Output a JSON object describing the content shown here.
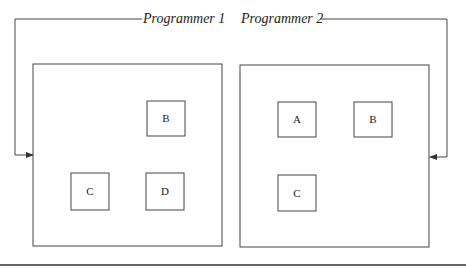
{
  "labels": {
    "programmer1": "Programmer 1",
    "programmer2": "Programmer 2"
  },
  "left_window": {
    "boxes": [
      {
        "label": "B"
      },
      {
        "label": "C"
      },
      {
        "label": "D"
      }
    ]
  },
  "right_window": {
    "boxes": [
      {
        "label": "A"
      },
      {
        "label": "B"
      },
      {
        "label": "C"
      }
    ]
  },
  "colors": {
    "stroke": "#333333",
    "background": "#ffffff"
  }
}
